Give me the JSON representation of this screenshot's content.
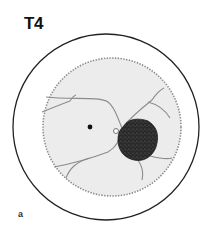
{
  "figure": {
    "title": "T4",
    "panel_label": "a",
    "elements": {
      "outer_circle": "eye-outline",
      "inner_disc": "fundus",
      "dot": "fovea",
      "dark_mass": "tumor-lesion",
      "lines": "retinal-vessels"
    },
    "colors": {
      "outline": "#222222",
      "fundus_fill": "#ececec",
      "fundus_edge": "#8a8a8a",
      "vessel": "#8c8c8c",
      "lesion": "#2a2a2a"
    }
  }
}
